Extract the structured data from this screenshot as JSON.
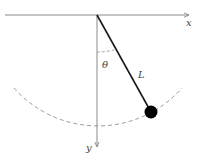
{
  "diagram": {
    "labels": {
      "x_axis": "x",
      "y_axis": "y",
      "angle": "θ",
      "length": "L"
    },
    "colors": {
      "axis": "#8a8a8a",
      "rod": "#1a1a1a",
      "bob": "#000000",
      "arc": "#9a9a9a",
      "text": "#444444"
    },
    "geometry": {
      "pivot": [
        97,
        15
      ],
      "bob_center": [
        151,
        112
      ],
      "bob_radius": 6.5,
      "swing_radius": 112
    }
  }
}
